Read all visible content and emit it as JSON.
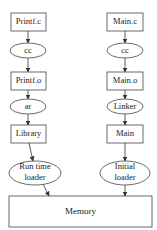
{
  "diagram": {
    "left_column": {
      "source": "Printf.c",
      "compiler": "cc",
      "object": "Printf.o",
      "archiver": "ar",
      "output": "Library",
      "loader_line1": "Run time",
      "loader_line2": "loader"
    },
    "right_column": {
      "source": "Main.c",
      "compiler": "cc",
      "object": "Main.o",
      "linker": "Linker",
      "output": "Main",
      "loader_line1": "Initial",
      "loader_line2": "loader"
    },
    "target": "Memory"
  }
}
